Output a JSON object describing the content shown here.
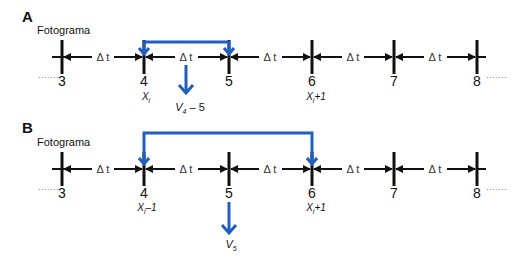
{
  "panels": [
    {
      "letter": "A",
      "frame_label": "Fotograma",
      "frames": [
        "3",
        "4",
        "5",
        "6",
        "7",
        "8"
      ],
      "interval_label": "Δ t",
      "leading_dots": "·······",
      "trailing_dots": "·······",
      "position_labels": {
        "4": "X",
        "4_sub": "i",
        "6": "X",
        "6_sub": "i",
        "6_suffix": "+1"
      },
      "velocity_label": "V",
      "velocity_sub": "4",
      "velocity_suffix": " – 5",
      "bracket_from": "4",
      "bracket_to": "5"
    },
    {
      "letter": "B",
      "frame_label": "Fotograma",
      "frames": [
        "3",
        "4",
        "5",
        "6",
        "7",
        "8"
      ],
      "interval_label": "Δ t",
      "leading_dots": "·······",
      "trailing_dots": "·······",
      "position_labels": {
        "4": "X",
        "4_sub": "i",
        "4_suffix": "–1",
        "6": "X",
        "6_sub": "i",
        "6_suffix": "+1"
      },
      "velocity_label": "V",
      "velocity_sub": "5",
      "bracket_from": "4",
      "bracket_to": "6"
    }
  ],
  "colors": {
    "accent": "#1f5fbf",
    "line": "#111111"
  }
}
